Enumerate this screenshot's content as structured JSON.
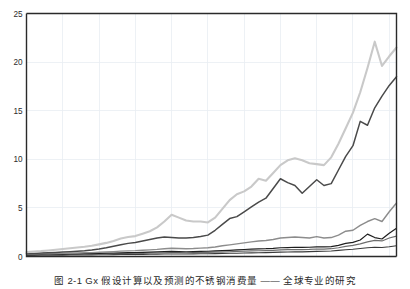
{
  "figure": {
    "caption": "图 2-1  Gx 假设计算以及预测的不锈钢消费量 —— 全球专业的研究"
  },
  "chart_data": {
    "type": "line",
    "title": "",
    "xlabel": "",
    "ylabel": "",
    "xlim": [
      1960,
      2011
    ],
    "ylim": [
      0,
      25
    ],
    "yticks": [
      0,
      5,
      10,
      15,
      20,
      25
    ],
    "xticks": [
      1960,
      1965,
      1970,
      1975,
      1980,
      1985,
      1990,
      1995,
      2000,
      2005,
      2010
    ],
    "grid": true,
    "legend": "none",
    "x": [
      1960,
      1961,
      1962,
      1963,
      1964,
      1965,
      1966,
      1967,
      1968,
      1969,
      1970,
      1971,
      1972,
      1973,
      1974,
      1975,
      1976,
      1977,
      1978,
      1979,
      1980,
      1981,
      1982,
      1983,
      1984,
      1985,
      1986,
      1987,
      1988,
      1989,
      1990,
      1991,
      1992,
      1993,
      1994,
      1995,
      1996,
      1997,
      1998,
      1999,
      2000,
      2001,
      2002,
      2003,
      2004,
      2005,
      2006,
      2007,
      2008,
      2009,
      2010,
      2011
    ],
    "series": [
      {
        "name": "series-1-light-gray",
        "color": "#c9c9c9",
        "width": 2.1,
        "values": [
          0.45,
          0.5,
          0.55,
          0.62,
          0.7,
          0.78,
          0.85,
          0.92,
          1.0,
          1.1,
          1.25,
          1.4,
          1.6,
          1.85,
          2.0,
          2.1,
          2.35,
          2.6,
          3.0,
          3.6,
          4.3,
          4.0,
          3.7,
          3.6,
          3.6,
          3.5,
          4.0,
          4.9,
          5.8,
          6.4,
          6.7,
          7.2,
          8.0,
          7.8,
          8.6,
          9.4,
          9.9,
          10.1,
          9.9,
          9.6,
          9.5,
          9.4,
          10.2,
          11.6,
          13.2,
          14.8,
          16.9,
          19.4,
          22.1,
          19.6,
          20.6,
          21.5
        ]
      },
      {
        "name": "series-2-dark",
        "color": "#4a4a4a",
        "width": 1.5,
        "values": [
          0.3,
          0.32,
          0.35,
          0.38,
          0.42,
          0.46,
          0.5,
          0.55,
          0.6,
          0.68,
          0.78,
          0.9,
          1.05,
          1.2,
          1.35,
          1.45,
          1.6,
          1.75,
          1.9,
          2.0,
          1.95,
          1.9,
          1.9,
          1.95,
          2.05,
          2.2,
          2.7,
          3.3,
          3.9,
          4.1,
          4.6,
          5.1,
          5.6,
          6.0,
          7.0,
          8.0,
          7.6,
          7.3,
          6.5,
          7.2,
          7.9,
          7.3,
          7.5,
          8.9,
          10.3,
          11.4,
          13.9,
          13.5,
          15.3,
          16.5,
          17.6,
          18.5
        ]
      },
      {
        "name": "series-3-medium-gray",
        "color": "#8c8c8c",
        "width": 1.4,
        "values": [
          0.25,
          0.26,
          0.27,
          0.29,
          0.3,
          0.32,
          0.34,
          0.36,
          0.38,
          0.4,
          0.43,
          0.46,
          0.5,
          0.55,
          0.58,
          0.6,
          0.64,
          0.68,
          0.73,
          0.8,
          0.85,
          0.82,
          0.8,
          0.82,
          0.86,
          0.9,
          0.98,
          1.1,
          1.2,
          1.3,
          1.4,
          1.5,
          1.6,
          1.65,
          1.75,
          1.9,
          1.95,
          2.0,
          1.95,
          1.9,
          2.05,
          1.9,
          1.95,
          2.2,
          2.6,
          2.7,
          3.2,
          3.6,
          3.9,
          3.6,
          4.6,
          5.5
        ]
      },
      {
        "name": "series-4-black",
        "color": "#1e1e1e",
        "width": 1.2,
        "values": [
          0.2,
          0.21,
          0.22,
          0.23,
          0.24,
          0.25,
          0.26,
          0.27,
          0.29,
          0.3,
          0.32,
          0.34,
          0.36,
          0.38,
          0.4,
          0.41,
          0.43,
          0.45,
          0.47,
          0.5,
          0.52,
          0.5,
          0.49,
          0.5,
          0.52,
          0.54,
          0.57,
          0.6,
          0.64,
          0.68,
          0.72,
          0.75,
          0.78,
          0.8,
          0.84,
          0.9,
          0.92,
          0.95,
          0.93,
          0.95,
          1.0,
          0.98,
          1.02,
          1.15,
          1.35,
          1.45,
          1.7,
          2.3,
          1.95,
          1.8,
          2.4,
          2.9
        ]
      },
      {
        "name": "series-5-gray",
        "color": "#6e6e6e",
        "width": 1.2,
        "values": [
          0.18,
          0.18,
          0.19,
          0.2,
          0.2,
          0.21,
          0.22,
          0.23,
          0.24,
          0.25,
          0.26,
          0.27,
          0.29,
          0.3,
          0.31,
          0.32,
          0.33,
          0.35,
          0.36,
          0.38,
          0.4,
          0.39,
          0.38,
          0.39,
          0.4,
          0.42,
          0.44,
          0.46,
          0.49,
          0.52,
          0.55,
          0.57,
          0.59,
          0.61,
          0.64,
          0.68,
          0.7,
          0.72,
          0.71,
          0.73,
          0.77,
          0.76,
          0.8,
          0.9,
          1.05,
          1.15,
          1.3,
          1.5,
          1.65,
          1.6,
          1.9,
          2.1
        ]
      },
      {
        "name": "series-6-dark-flat",
        "color": "#3a3a3a",
        "width": 1.1,
        "values": [
          0.12,
          0.12,
          0.13,
          0.13,
          0.14,
          0.14,
          0.15,
          0.15,
          0.16,
          0.17,
          0.18,
          0.18,
          0.19,
          0.2,
          0.21,
          0.21,
          0.22,
          0.23,
          0.24,
          0.25,
          0.26,
          0.26,
          0.26,
          0.27,
          0.28,
          0.29,
          0.3,
          0.31,
          0.33,
          0.34,
          0.36,
          0.37,
          0.39,
          0.4,
          0.42,
          0.45,
          0.46,
          0.48,
          0.48,
          0.5,
          0.53,
          0.54,
          0.57,
          0.63,
          0.7,
          0.75,
          0.82,
          0.9,
          0.95,
          0.92,
          1.0,
          1.1
        ]
      }
    ]
  }
}
